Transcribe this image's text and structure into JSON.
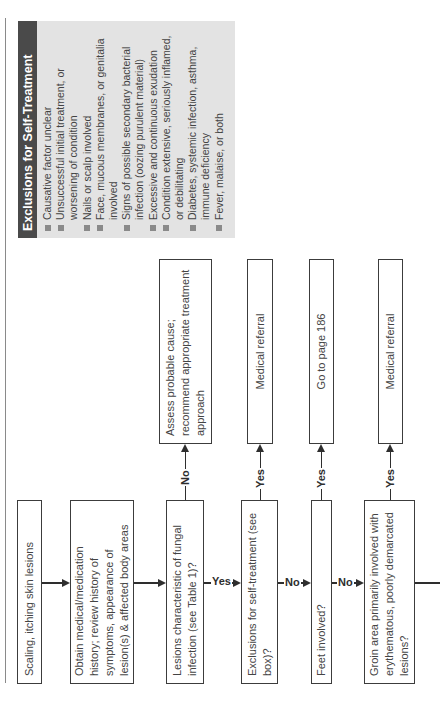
{
  "exclusions_box": {
    "title": "Exclusions for Self-Treatment",
    "items": [
      "Causative factor unclear",
      "Unsuccessful initial treatment, or worsening of condition",
      "Nails or scalp involved",
      "Face, mucous membranes, or genitalia involved",
      "Signs of possible secondary bacterial infection (oozing purulent material)",
      "Excessive and continuous exudation",
      "Condition extensive, seriously inflamed, or debilitating",
      "Diabetes, systemic infection, asthma, immune deficiency",
      "Fever, malaise, or both"
    ],
    "colors": {
      "title_bg": "#4a4a4a",
      "body_bg": "#e3e3e3",
      "bullet": "#8a8a8a"
    }
  },
  "flow": {
    "main": [
      {
        "id": "start",
        "text": "Scaling, itching skin lesions"
      },
      {
        "id": "history",
        "text": "Obtain medical/medication history; review history of symptoms, appearance of lesion(s) & affected body areas"
      },
      {
        "id": "fungal",
        "text": "Lesions characteristic of fungal infection (see Table 1)?"
      },
      {
        "id": "exclusions",
        "text": "Exclusions for self-treatment (see box)?"
      },
      {
        "id": "feet",
        "text": "Feet involved?"
      },
      {
        "id": "groin",
        "text": "Groin area primarily involved with erythematous, poorly demarcated lesions?"
      }
    ],
    "branches": [
      {
        "id": "assess",
        "text": "Assess probable cause; recommend appropriate treatment approach",
        "edge_label": "No"
      },
      {
        "id": "referral1",
        "text": "Medical referral",
        "edge_label": "Yes"
      },
      {
        "id": "goto186",
        "text": "Go to page 186",
        "edge_label": "Yes"
      },
      {
        "id": "referral2",
        "text": "Medical referral",
        "edge_label": "Yes"
      }
    ],
    "main_edge_labels": {
      "fungal_to_exclusions": "Yes",
      "exclusions_to_feet": "No",
      "feet_to_groin": "No"
    }
  }
}
